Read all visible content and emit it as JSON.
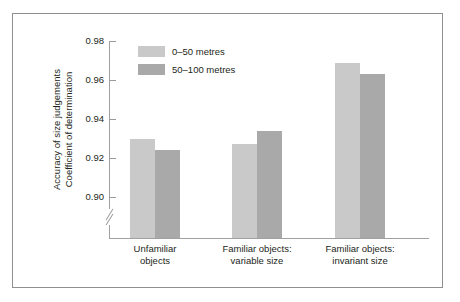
{
  "chart_data": {
    "type": "bar",
    "title": "",
    "subtitle": "",
    "xlabel": "",
    "ylabel_line1": "Accuracy of size judgements",
    "ylabel_line2": "Coefficient of determination",
    "categories": [
      "Unfamiliar\nobjects",
      "Familiar objects:\nvariable size",
      "Familiar objects:\ninvariant size"
    ],
    "category_labels": [
      {
        "line1": "Unfamiliar",
        "line2": "objects"
      },
      {
        "line1": "Familiar objects:",
        "line2": "variable size"
      },
      {
        "line1": "Familiar objects:",
        "line2": "invariant size"
      }
    ],
    "series": [
      {
        "name": "0–50 metres",
        "color": "#c9c9c9",
        "values": [
          0.941,
          0.938,
          0.98
        ]
      },
      {
        "name": "50–100 metres",
        "color": "#a9a9a9",
        "values": [
          0.935,
          0.945,
          0.974
        ]
      }
    ],
    "ylim": [
      0.89,
      0.98
    ],
    "yticks": [
      0.98,
      0.96,
      0.94,
      0.92,
      0.9
    ],
    "ytick_labels": [
      "0.98",
      "0.96",
      "0.94",
      "0.92",
      "0.90"
    ],
    "grid": false,
    "axis_break": true,
    "legend_position": "top-left-inside",
    "frame": true
  },
  "legend": {
    "items": [
      {
        "label": "0–50 metres",
        "swatch": "light"
      },
      {
        "label": "50–100 metres",
        "swatch": "dark"
      }
    ]
  },
  "colors": {
    "series_light": "#c9c9c9",
    "series_dark": "#a9a9a9",
    "axis": "#a0a0a0",
    "text": "#231f20",
    "frame_border": "#8e8e93",
    "background": "#ffffff"
  }
}
